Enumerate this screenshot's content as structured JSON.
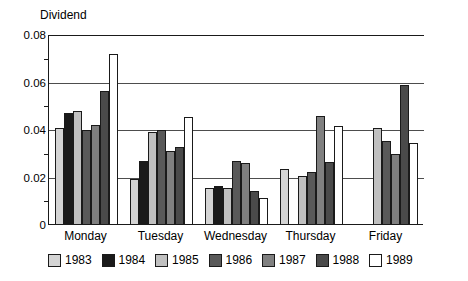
{
  "chart_data": {
    "type": "bar",
    "title": "",
    "ylabel": "Dividend",
    "xlabel": "",
    "ylim": [
      0,
      0.08
    ],
    "yticks": [
      "0",
      "0.02",
      "0.04",
      "0.06",
      "0.08"
    ],
    "ytick_values": [
      0,
      0.02,
      0.04,
      0.06,
      0.08
    ],
    "grid": true,
    "legend_position": "bottom",
    "categories": [
      "Monday",
      "Tuesday",
      "Wednesday",
      "Thursday",
      "Friday"
    ],
    "series": [
      {
        "name": "1983",
        "color": "#d4d4d4",
        "values": [
          0.041,
          0.0195,
          0.0155,
          0.0235,
          0.0
        ]
      },
      {
        "name": "1984",
        "color": "#1a1a1a",
        "values": [
          0.047,
          0.027,
          0.0165,
          0.0,
          0.0
        ]
      },
      {
        "name": "1985",
        "color": "#c0c0c0",
        "values": [
          0.048,
          0.039,
          0.0155,
          0.0205,
          0.041
        ]
      },
      {
        "name": "1986",
        "color": "#595959",
        "values": [
          0.04,
          0.04,
          0.027,
          0.0225,
          0.0355
        ]
      },
      {
        "name": "1987",
        "color": "#808080",
        "values": [
          0.042,
          0.031,
          0.026,
          0.046,
          0.03
        ]
      },
      {
        "name": "1988",
        "color": "#4a4a4a",
        "values": [
          0.0565,
          0.033,
          0.0145,
          0.0265,
          0.059
        ]
      },
      {
        "name": "1989",
        "color": "#ffffff",
        "values": [
          0.072,
          0.0455,
          0.0115,
          0.0415,
          0.0345
        ]
      }
    ]
  },
  "legend": {
    "items": [
      {
        "label": "1983"
      },
      {
        "label": "1984"
      },
      {
        "label": "1985"
      },
      {
        "label": "1986"
      },
      {
        "label": "1987"
      },
      {
        "label": "1988"
      },
      {
        "label": "1989"
      }
    ]
  },
  "colors": {
    "axis": "#1a1a1a",
    "grid": "#4d4d4d",
    "background": "#ffffff"
  }
}
